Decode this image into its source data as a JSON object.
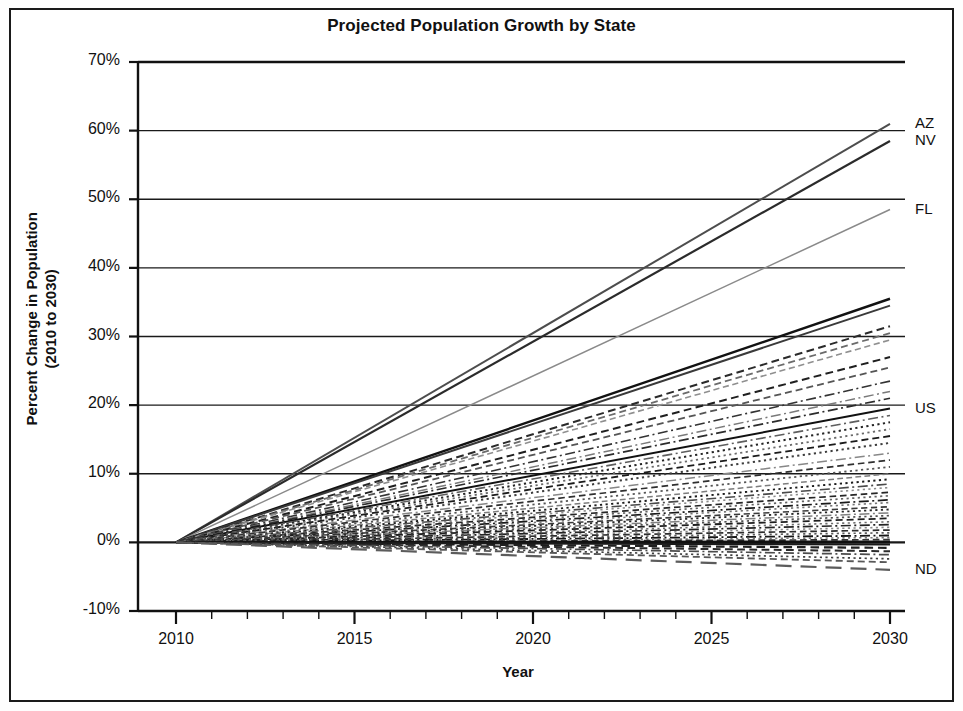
{
  "chart_data": {
    "type": "line",
    "title": "Projected Population Growth by State",
    "xlabel": "Year",
    "ylabel": "Percent Change in Population (2010 to 2030)",
    "ylabel_line1": "Percent Change in Population",
    "ylabel_line2": "(2010 to 2030)",
    "xlim": [
      2010,
      2030
    ],
    "ylim": [
      -10,
      70
    ],
    "x_major_ticks": [
      2010,
      2015,
      2020,
      2025,
      2030
    ],
    "x_minor_tick_interval": 1,
    "x_tick_labels": [
      "2010",
      "2015",
      "2020",
      "2025",
      "2030"
    ],
    "y_ticks": [
      -10,
      0,
      10,
      20,
      30,
      40,
      50,
      60,
      70
    ],
    "y_tick_labels": [
      "-10%",
      "0%",
      "10%",
      "20%",
      "30%",
      "40%",
      "50%",
      "60%",
      "70%"
    ],
    "grid": "horizontal",
    "legend_position": "right-edge-labels",
    "note": "All series start at 0% in 2010 and grow linearly to their 2030 value.",
    "annotations": [
      {
        "label": "AZ",
        "x": 2030,
        "y": 61.0
      },
      {
        "label": "NV",
        "x": 2030,
        "y": 58.5
      },
      {
        "label": "FL",
        "x": 2030,
        "y": 48.5
      },
      {
        "label": "US",
        "x": 2030,
        "y": 19.5
      },
      {
        "label": "ND",
        "x": 2030,
        "y": -4.0
      }
    ],
    "series": [
      {
        "name": "AZ",
        "end_value": 61.0,
        "style": "solid",
        "color": "#4d4d4d",
        "width": 2.0,
        "labeled": true
      },
      {
        "name": "NV",
        "end_value": 58.5,
        "style": "solid",
        "color": "#2b2b2b",
        "width": 2.2,
        "labeled": true
      },
      {
        "name": "FL",
        "end_value": 48.5,
        "style": "solid",
        "color": "#8a8a8a",
        "width": 1.5,
        "labeled": true
      },
      {
        "name": "TX",
        "end_value": 35.5,
        "style": "solid",
        "color": "#121212",
        "width": 2.4,
        "labeled": false
      },
      {
        "name": "UT",
        "end_value": 34.5,
        "style": "solid",
        "color": "#3a3a3a",
        "width": 2.0,
        "labeled": false
      },
      {
        "name": "ID",
        "end_value": 31.5,
        "style": "dashed",
        "color": "#2a2a2a",
        "width": 2.0,
        "labeled": false
      },
      {
        "name": "GA",
        "end_value": 30.5,
        "style": "dashed",
        "color": "#6b6b6b",
        "width": 1.8,
        "labeled": false
      },
      {
        "name": "NC",
        "end_value": 29.5,
        "style": "dashed",
        "color": "#8f8f8f",
        "width": 1.6,
        "labeled": false
      },
      {
        "name": "CO",
        "end_value": 27.0,
        "style": "dashed",
        "color": "#1f1f1f",
        "width": 2.0,
        "labeled": false
      },
      {
        "name": "SC",
        "end_value": 25.5,
        "style": "dashed",
        "color": "#555555",
        "width": 1.8,
        "labeled": false
      },
      {
        "name": "WA",
        "end_value": 23.5,
        "style": "dashdot",
        "color": "#333333",
        "width": 1.6,
        "labeled": false
      },
      {
        "name": "DE",
        "end_value": 22.0,
        "style": "dashdot",
        "color": "#7a7a7a",
        "width": 1.5,
        "labeled": false
      },
      {
        "name": "VA",
        "end_value": 21.0,
        "style": "dashdot",
        "color": "#2c2c2c",
        "width": 1.7,
        "labeled": false
      },
      {
        "name": "US",
        "end_value": 19.5,
        "style": "solid",
        "color": "#111111",
        "width": 2.0,
        "labeled": true
      },
      {
        "name": "OR",
        "end_value": 18.5,
        "style": "dashdot",
        "color": "#5e5e5e",
        "width": 1.6,
        "labeled": false
      },
      {
        "name": "NM",
        "end_value": 17.5,
        "style": "dotted",
        "color": "#242424",
        "width": 2.0,
        "labeled": false
      },
      {
        "name": "MD",
        "end_value": 16.5,
        "style": "dotted",
        "color": "#6a6a6a",
        "width": 1.8,
        "labeled": false
      },
      {
        "name": "TN",
        "end_value": 15.5,
        "style": "dashed",
        "color": "#1b1b1b",
        "width": 1.8,
        "labeled": false
      },
      {
        "name": "CA",
        "end_value": 14.5,
        "style": "dotted",
        "color": "#3d3d3d",
        "width": 2.0,
        "labeled": false
      },
      {
        "name": "AK",
        "end_value": 13.0,
        "style": "dashdot",
        "color": "#878787",
        "width": 1.5,
        "labeled": false
      },
      {
        "name": "HI",
        "end_value": 12.0,
        "style": "dashed",
        "color": "#2f2f2f",
        "width": 1.7,
        "labeled": false
      },
      {
        "name": "AR",
        "end_value": 11.0,
        "style": "dotted",
        "color": "#555555",
        "width": 1.8,
        "labeled": false
      },
      {
        "name": "MN",
        "end_value": 10.0,
        "style": "dashed",
        "color": "#7d7d7d",
        "width": 1.5,
        "labeled": false
      },
      {
        "name": "OK",
        "end_value": 9.2,
        "style": "dotted",
        "color": "#1c1c1c",
        "width": 1.9,
        "labeled": false
      },
      {
        "name": "NH",
        "end_value": 8.5,
        "style": "dashdot",
        "color": "#4a4a4a",
        "width": 1.6,
        "labeled": false
      },
      {
        "name": "AL",
        "end_value": 8.0,
        "style": "dotted",
        "color": "#8c8c8c",
        "width": 1.6,
        "labeled": false
      },
      {
        "name": "KY",
        "end_value": 7.3,
        "style": "dashed",
        "color": "#262626",
        "width": 1.7,
        "labeled": false
      },
      {
        "name": "MO",
        "end_value": 6.8,
        "style": "dotted",
        "color": "#636363",
        "width": 1.7,
        "labeled": false
      },
      {
        "name": "WI",
        "end_value": 6.2,
        "style": "dashdot",
        "color": "#1a1a1a",
        "width": 1.7,
        "labeled": false
      },
      {
        "name": "IN",
        "end_value": 5.8,
        "style": "dotted",
        "color": "#747474",
        "width": 1.6,
        "labeled": false
      },
      {
        "name": "SD",
        "end_value": 5.2,
        "style": "dashed",
        "color": "#3a3a3a",
        "width": 1.6,
        "labeled": false
      },
      {
        "name": "NE",
        "end_value": 4.8,
        "style": "dotted",
        "color": "#2a2a2a",
        "width": 1.8,
        "labeled": false
      },
      {
        "name": "MT",
        "end_value": 4.3,
        "style": "dashdot",
        "color": "#808080",
        "width": 1.5,
        "labeled": false
      },
      {
        "name": "NJ",
        "end_value": 3.9,
        "style": "dotted",
        "color": "#4f4f4f",
        "width": 1.7,
        "labeled": false
      },
      {
        "name": "KS",
        "end_value": 3.5,
        "style": "dashed",
        "color": "#1e1e1e",
        "width": 1.8,
        "labeled": false
      },
      {
        "name": "ME",
        "end_value": 3.0,
        "style": "dotted",
        "color": "#6e6e6e",
        "width": 1.6,
        "labeled": false
      },
      {
        "name": "MS",
        "end_value": 2.6,
        "style": "dashdot",
        "color": "#232323",
        "width": 1.7,
        "labeled": false
      },
      {
        "name": "IL",
        "end_value": 2.2,
        "style": "dotted",
        "color": "#8a8a8a",
        "width": 1.6,
        "labeled": false
      },
      {
        "name": "CT",
        "end_value": 1.8,
        "style": "dashed",
        "color": "#2d2d2d",
        "width": 1.7,
        "labeled": false
      },
      {
        "name": "IA",
        "end_value": 1.4,
        "style": "dotted",
        "color": "#5a5a5a",
        "width": 1.7,
        "labeled": false
      },
      {
        "name": "VT",
        "end_value": 1.0,
        "style": "dashdot",
        "color": "#161616",
        "width": 1.8,
        "labeled": false
      },
      {
        "name": "MA",
        "end_value": 0.7,
        "style": "dotted",
        "color": "#777777",
        "width": 1.6,
        "labeled": false
      },
      {
        "name": "WY",
        "end_value": 0.4,
        "style": "dashed",
        "color": "#333333",
        "width": 1.7,
        "labeled": false
      },
      {
        "name": "RI",
        "end_value": 0.1,
        "style": "solid",
        "color": "#101010",
        "width": 2.6,
        "labeled": false
      },
      {
        "name": "OH",
        "end_value": -0.3,
        "style": "solid",
        "color": "#1a1a1a",
        "width": 2.2,
        "labeled": false
      },
      {
        "name": "MI",
        "end_value": -0.8,
        "style": "dashed",
        "color": "#1f1f1f",
        "width": 2.2,
        "labeled": false
      },
      {
        "name": "PA",
        "end_value": -1.3,
        "style": "dashed",
        "color": "#2b2b2b",
        "width": 2.0,
        "labeled": false
      },
      {
        "name": "LA",
        "end_value": -1.8,
        "style": "dashdot",
        "color": "#4c4c4c",
        "width": 1.7,
        "labeled": false
      },
      {
        "name": "WV",
        "end_value": -2.4,
        "style": "dotted",
        "color": "#3f3f3f",
        "width": 1.7,
        "labeled": false
      },
      {
        "name": "NY",
        "end_value": -2.9,
        "style": "dashed",
        "color": "#585858",
        "width": 1.8,
        "labeled": false
      },
      {
        "name": "ND",
        "end_value": -4.0,
        "style": "dashed-long",
        "color": "#5c5c5c",
        "width": 2.2,
        "labeled": true
      }
    ]
  }
}
